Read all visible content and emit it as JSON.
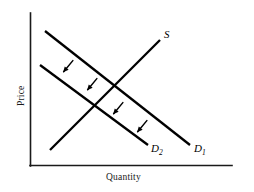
{
  "figure": {
    "type": "economics-supply-demand-diagram",
    "background_color": "#ffffff",
    "line_color": "#000000",
    "axes": {
      "y_axis_label": "Price",
      "x_axis_label": "Quantity",
      "y_axis": {
        "x": 30,
        "y_top": 13,
        "y_bottom": 166
      },
      "x_axis": {
        "y": 166,
        "x_left": 30,
        "x_right": 232
      }
    },
    "curves": [
      {
        "id": "supply",
        "label": "S",
        "subscript": "",
        "slope": "upward",
        "x1": 50,
        "y1": 150,
        "x2": 160,
        "y2": 40,
        "label_x": 164,
        "label_y": 38
      },
      {
        "id": "demand-1",
        "label": "D",
        "subscript": "1",
        "slope": "downward",
        "x1": 45,
        "y1": 31,
        "x2": 190,
        "y2": 145,
        "label_x": 194,
        "label_y": 152
      },
      {
        "id": "demand-2",
        "label": "D",
        "subscript": "2",
        "slope": "downward",
        "x1": 40,
        "y1": 65,
        "x2": 148,
        "y2": 145,
        "label_x": 151,
        "label_y": 152
      }
    ],
    "shift_arrows": {
      "direction": "down-left",
      "meaning": "leftward-shift-of-demand",
      "count": 4,
      "positions": [
        {
          "x": 70,
          "y": 64
        },
        {
          "x": 94,
          "y": 82
        },
        {
          "x": 120,
          "y": 106
        },
        {
          "x": 144,
          "y": 124
        }
      ]
    }
  }
}
